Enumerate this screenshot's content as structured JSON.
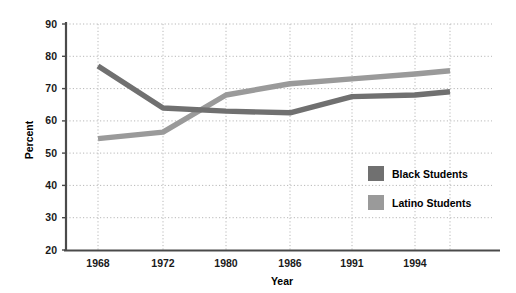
{
  "chart_data": {
    "type": "line",
    "title": "",
    "xlabel": "Year",
    "ylabel": "Percent",
    "ylim": [
      20,
      90
    ],
    "ytick_values": [
      20,
      30,
      40,
      50,
      60,
      70,
      80,
      90
    ],
    "ytick_labels": [
      "20",
      "30",
      "40",
      "50",
      "60",
      "70",
      "80",
      "90"
    ],
    "x": [
      1968,
      1972,
      1980,
      1986,
      1991,
      1994,
      1998
    ],
    "xtick_labels": [
      "1968",
      "1972",
      "1980",
      "1986",
      "1991",
      "1994",
      ""
    ],
    "grid": "dotted-both-axes",
    "legend_position": "inside-lower-right",
    "series": [
      {
        "name": "Black Students",
        "color": "#707070",
        "values": [
          77,
          64,
          63,
          62.5,
          67.5,
          68,
          69
        ]
      },
      {
        "name": "Latino Students",
        "color": "#9a9a9a",
        "values": [
          54.5,
          56.5,
          68,
          71.5,
          73,
          74.5,
          75.5
        ]
      }
    ]
  },
  "legend": {
    "items": [
      {
        "label": "Black Students",
        "swatch_color": "#707070"
      },
      {
        "label": "Latino Students",
        "swatch_color": "#9a9a9a"
      }
    ]
  },
  "axes": {
    "y_title": "Percent",
    "x_title": "Year"
  },
  "colors": {
    "background": "#ffffff",
    "axis_line": "#444444",
    "gridline": "#b8b8b8",
    "text": "#1a1a1a"
  }
}
